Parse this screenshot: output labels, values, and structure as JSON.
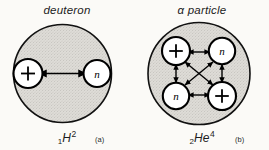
{
  "figure": {
    "background_color": "#fbfaf7",
    "nucleus_fill": "#d9d7d2",
    "outline_color": "#111111"
  },
  "panels": [
    {
      "id": "deuteron",
      "title": "deuteron",
      "caption_letter": "(a)",
      "nuclide": {
        "atomic_number": "1",
        "symbol": "H",
        "mass_number": "2"
      },
      "nucleons": [
        {
          "id": "proton-1",
          "label": "+",
          "kind": "proton"
        },
        {
          "id": "neutron-1",
          "label": "n",
          "kind": "neutron"
        }
      ],
      "bonds": 1
    },
    {
      "id": "alpha-particle",
      "title": "α particle",
      "caption_letter": "(b)",
      "nuclide": {
        "atomic_number": "2",
        "symbol": "He",
        "mass_number": "4"
      },
      "nucleons": [
        {
          "id": "proton-top-left",
          "label": "+",
          "kind": "proton"
        },
        {
          "id": "neutron-top-right",
          "label": "n",
          "kind": "neutron"
        },
        {
          "id": "neutron-bottom-left",
          "label": "n",
          "kind": "neutron"
        },
        {
          "id": "proton-bottom-right",
          "label": "+",
          "kind": "proton"
        }
      ],
      "bonds": 6
    }
  ]
}
